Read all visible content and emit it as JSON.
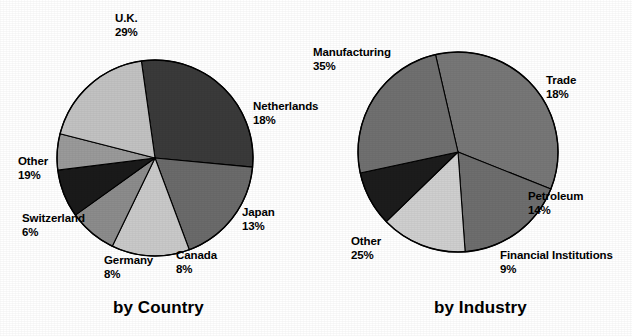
{
  "page": {
    "background_color": "#ffffff",
    "width": 632,
    "height": 336
  },
  "chart_data": [
    {
      "type": "pie",
      "id": "by-country",
      "title": "by Country",
      "caption": "by Country",
      "center": [
        155,
        158
      ],
      "radius": 98,
      "start_angle_deg": -8,
      "direction": "clockwise",
      "categories": [
        "U.K.",
        "Netherlands",
        "Japan",
        "Canada",
        "Germany",
        "Switzerland",
        "Other"
      ],
      "values": [
        29,
        18,
        13,
        8,
        8,
        6,
        19
      ],
      "value_suffix": "%",
      "colors": [
        "#3a3a3a",
        "#6b6b6b",
        "#c9c9c9",
        "#8c8c8c",
        "#1a1a1a",
        "#9a9a9a",
        "#c2c2c2"
      ],
      "slices": [
        {
          "label": "U.K.",
          "pct": 29,
          "pct_text": "29%",
          "color": "#3a3a3a",
          "label_x": 115,
          "label_y": 12,
          "align": "left"
        },
        {
          "label": "Netherlands",
          "pct": 18,
          "pct_text": "18%",
          "color": "#6b6b6b",
          "label_x": 253,
          "label_y": 100,
          "align": "left"
        },
        {
          "label": "Japan",
          "pct": 13,
          "pct_text": "13%",
          "color": "#c9c9c9",
          "label_x": 242,
          "label_y": 206,
          "align": "left"
        },
        {
          "label": "Canada",
          "pct": 8,
          "pct_text": "8%",
          "color": "#8c8c8c",
          "label_x": 176,
          "label_y": 249,
          "align": "left"
        },
        {
          "label": "Germany",
          "pct": 8,
          "pct_text": "8%",
          "color": "#1a1a1a",
          "label_x": 104,
          "label_y": 254,
          "align": "left"
        },
        {
          "label": "Switzerland",
          "pct": 6,
          "pct_text": "6%",
          "color": "#9a9a9a",
          "label_x": 22,
          "label_y": 212,
          "align": "left"
        },
        {
          "label": "Other",
          "pct": 19,
          "pct_text": "19%",
          "color": "#c2c2c2",
          "label_x": 18,
          "label_y": 155,
          "align": "left"
        }
      ],
      "caption_x": 113,
      "caption_y": 298
    },
    {
      "type": "pie",
      "id": "by-industry",
      "title": "by Industry",
      "caption": "by Industry",
      "center": [
        458,
        152
      ],
      "radius": 100,
      "start_angle_deg": -13,
      "direction": "clockwise",
      "categories": [
        "Manufacturing",
        "Trade",
        "Petroleum",
        "Financial Institutions",
        "Other"
      ],
      "values": [
        35,
        18,
        14,
        9,
        25
      ],
      "value_suffix": "%",
      "colors": [
        "#777777",
        "#6e6e6e",
        "#cfcfcf",
        "#1c1c1c",
        "#707070"
      ],
      "slices": [
        {
          "label": "Trade",
          "pct": 18,
          "pct_text": "18%",
          "color": "#6e6e6e",
          "label_x": 546,
          "label_y": 74,
          "align": "left"
        },
        {
          "label": "Petroleum",
          "pct": 14,
          "pct_text": "14%",
          "color": "#cfcfcf",
          "label_x": 528,
          "label_y": 190,
          "align": "left"
        },
        {
          "label": "Financial Institutions",
          "pct": 9,
          "pct_text": "9%",
          "color": "#1c1c1c",
          "label_x": 500,
          "label_y": 249,
          "align": "left"
        },
        {
          "label": "Other",
          "pct": 25,
          "pct_text": "25%",
          "color": "#707070",
          "label_x": 351,
          "label_y": 235,
          "align": "left"
        },
        {
          "label": "Manufacturing",
          "pct": 35,
          "pct_text": "35%",
          "color": "#777777",
          "label_x": 313,
          "label_y": 46,
          "align": "left"
        }
      ],
      "caption_x": 434,
      "caption_y": 298
    }
  ],
  "country": {
    "caption": "by Country",
    "labels": {
      "uk": {
        "name": "U.K.",
        "pct": "29%"
      },
      "netherlands": {
        "name": "Netherlands",
        "pct": "18%"
      },
      "japan": {
        "name": "Japan",
        "pct": "13%"
      },
      "canada": {
        "name": "Canada",
        "pct": "8%"
      },
      "germany": {
        "name": "Germany",
        "pct": "8%"
      },
      "switzerland": {
        "name": "Switzerland",
        "pct": "6%"
      },
      "other": {
        "name": "Other",
        "pct": "19%"
      }
    }
  },
  "industry": {
    "caption": "by Industry",
    "labels": {
      "manufacturing": {
        "name": "Manufacturing",
        "pct": "35%"
      },
      "trade": {
        "name": "Trade",
        "pct": "18%"
      },
      "petroleum": {
        "name": "Petroleum",
        "pct": "14%"
      },
      "financial": {
        "name": "Financial Institutions",
        "pct": "9%"
      },
      "other": {
        "name": "Other",
        "pct": "25%"
      }
    }
  }
}
